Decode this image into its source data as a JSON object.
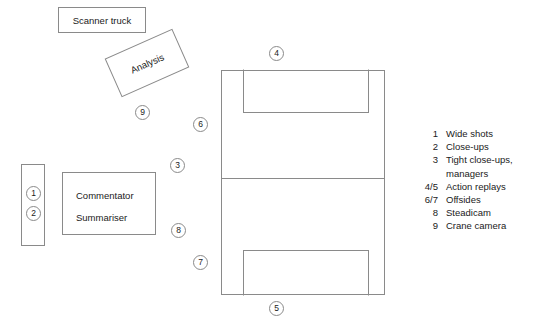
{
  "diagram": {
    "facilities": {
      "scanner_truck": "Scanner truck",
      "analysis": "Analysis",
      "commentator": "Commentator",
      "summariser": "Summariser"
    },
    "camera_markers": [
      {
        "id": "marker-1",
        "label": "1"
      },
      {
        "id": "marker-2",
        "label": "2"
      },
      {
        "id": "marker-3",
        "label": "3"
      },
      {
        "id": "marker-4",
        "label": "4"
      },
      {
        "id": "marker-5",
        "label": "5"
      },
      {
        "id": "marker-6",
        "label": "6"
      },
      {
        "id": "marker-7",
        "label": "7"
      },
      {
        "id": "marker-8",
        "label": "8"
      },
      {
        "id": "marker-9",
        "label": "9"
      }
    ],
    "legend": [
      {
        "key": "1",
        "text": "Wide shots"
      },
      {
        "key": "2",
        "text": "Close-ups"
      },
      {
        "key": "3",
        "text": "Tight close-ups,\nmanagers"
      },
      {
        "key": "4/5",
        "text": "Action replays"
      },
      {
        "key": "6/7",
        "text": "Offsides"
      },
      {
        "key": "8",
        "text": "Steadicam"
      },
      {
        "key": "9",
        "text": "Crane camera"
      }
    ],
    "colors": {
      "line": "#8a8a8a",
      "text": "#1a1a1a",
      "background": "#ffffff"
    }
  }
}
